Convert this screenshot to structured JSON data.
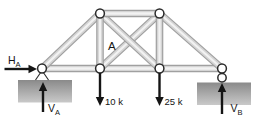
{
  "figure": {
    "kind": "truss-free-body-diagram",
    "joint_label": "A",
    "reactions": {
      "ha": {
        "base": "H",
        "sub": "A",
        "direction": "right"
      },
      "va": {
        "base": "V",
        "sub": "A",
        "direction": "up"
      },
      "vb": {
        "base": "V",
        "sub": "B",
        "direction": "up"
      }
    },
    "loads": {
      "load1": {
        "label": "10 k",
        "value": 10,
        "unit": "k",
        "direction": "down"
      },
      "load2": {
        "label": "25 k",
        "value": 25,
        "unit": "k",
        "direction": "down"
      }
    },
    "supports": {
      "left": "pin",
      "right": "roller"
    },
    "colors": {
      "background": "#ffffff",
      "member_edge": "#a0a0a0",
      "member_mid": "#d4d4d4",
      "member_core": "#f2f2f2",
      "ground_top": "#8a8a8a",
      "ground_bottom": "#c9c9c9",
      "node_stroke": "#2b2b2b",
      "ink": "#151515"
    }
  }
}
